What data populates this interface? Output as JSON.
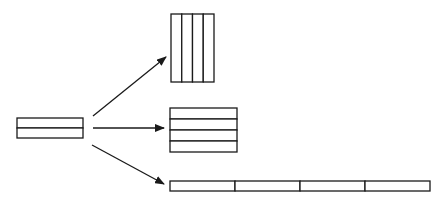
{
  "diagram": {
    "colors": {
      "stroke": "#1a1a1a",
      "fill": "#ffffff",
      "background": "#ffffff"
    },
    "source": {
      "name": "source-block",
      "x": 17,
      "y": 118,
      "width": 66,
      "bar_height": 10,
      "bar_count": 2,
      "orientation": "stacked-horizontal"
    },
    "targets": [
      {
        "name": "target-vertical-bars",
        "x": 171,
        "y": 14,
        "bar_width": 10.75,
        "height": 68,
        "bar_count": 4,
        "orientation": "side-by-side-vertical"
      },
      {
        "name": "target-stacked-bars",
        "x": 170,
        "y": 108,
        "width": 67,
        "bar_height": 11,
        "bar_count": 4,
        "orientation": "stacked-horizontal"
      },
      {
        "name": "target-end-to-end-strip",
        "x": 170,
        "y": 181,
        "segment_width": 65,
        "height": 10,
        "bar_count": 4,
        "orientation": "end-to-end"
      }
    ],
    "arrows": [
      {
        "name": "arrow-to-vertical",
        "x1": 93,
        "y1": 116,
        "x2": 166,
        "y2": 57
      },
      {
        "name": "arrow-to-stacked",
        "x1": 93,
        "y1": 128,
        "x2": 164,
        "y2": 128
      },
      {
        "name": "arrow-to-strip",
        "x1": 92,
        "y1": 145,
        "x2": 164,
        "y2": 184
      }
    ]
  }
}
